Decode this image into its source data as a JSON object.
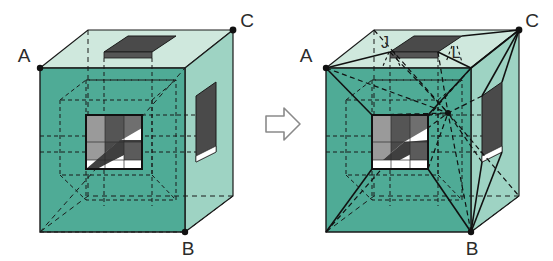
{
  "figure": {
    "type": "geometry-diagram",
    "background_color": "#ffffff"
  },
  "colors": {
    "front_face": "#4fab96",
    "right_face": "#9ed3c3",
    "top_face": "#cfe8dd",
    "hole_dark": "#4a4a4a",
    "hole_mid": "#6f6f6f",
    "hole_light": "#a8a8a8",
    "white": "#ffffff",
    "line": "#1a1a1a",
    "arrow_stroke": "#8a8a8a",
    "arrow_fill": "#ffffff",
    "label_color": "#2b2b2b"
  },
  "arrow": {
    "name": "transformation-arrow",
    "direction": "right",
    "glyph": "⇨"
  },
  "left_cube": {
    "name": "cube-before",
    "labels": [
      {
        "id": "A",
        "text": "A",
        "x": 24,
        "y": 62
      },
      {
        "id": "B",
        "text": "B",
        "x": 188,
        "y": 247
      },
      {
        "id": "C",
        "text": "C",
        "x": 243,
        "y": 23
      }
    ],
    "vertices": {
      "A": "front-top-left",
      "B": "front-bottom-right",
      "C": "back-top-right"
    },
    "features": [
      "top-face-rectangular-hole",
      "right-face-rectangular-hole",
      "front-face-square-hole",
      "hidden-inner-tunnel-dashed"
    ]
  },
  "right_cube": {
    "name": "cube-after",
    "labels": [
      {
        "id": "A",
        "text": "A",
        "x": 300,
        "y": 62
      },
      {
        "id": "B",
        "text": "B",
        "x": 466,
        "y": 247
      },
      {
        "id": "C",
        "text": "C",
        "x": 521,
        "y": 23
      },
      {
        "id": "J",
        "text": "J",
        "x": 381,
        "y": 46
      },
      {
        "id": "L",
        "text": "L",
        "x": 461,
        "y": 57
      }
    ],
    "vertices": {
      "A": "front-top-left",
      "B": "front-bottom-right",
      "C": "back-top-right",
      "J": "top-hole-near-left",
      "L": "top-hole-far-right"
    },
    "features": [
      "top-face-rectangular-hole",
      "right-face-rectangular-hole",
      "front-face-square-hole",
      "solid-cut-lines-from-A-B-C-to-hole",
      "dashed-diagonals-to-interior-point",
      "hidden-inner-tunnel-dashed"
    ]
  }
}
